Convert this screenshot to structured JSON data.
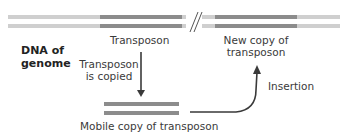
{
  "diagram": {
    "top_caption_partial": "",
    "genome_label": [
      "DNA of",
      "genome"
    ],
    "labels": {
      "transposon": "Transposon",
      "new_copy": [
        "New copy of",
        "transposon"
      ],
      "copied": [
        "Transposon",
        "is copied"
      ],
      "insertion": "Insertion",
      "mobile_copy": "Mobile copy of transposon"
    },
    "colors": {
      "flank_dna": "#cfcfcf",
      "transposon_dna": "#8c8c8c",
      "arrow": "#3a3a3a",
      "text": "#3a3a3a"
    }
  }
}
